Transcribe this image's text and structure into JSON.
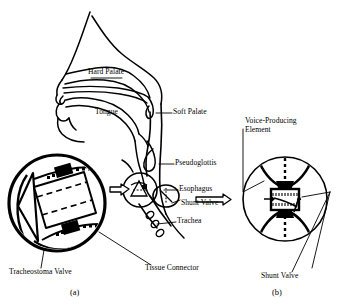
{
  "figure": {
    "background_color": "#ffffff",
    "ink_color": "#000000"
  },
  "panels": [
    {
      "id": "a",
      "letter": "(a)",
      "caption": "(a)"
    },
    {
      "id": "b",
      "letter": "(b)",
      "caption": "(b)"
    }
  ],
  "labels": {
    "hard_palate": "Hard Palate",
    "tongue": "Tongue",
    "soft_palate": "Soft Palate",
    "pseudoglottis": "Pseudoglottis",
    "esophagus": "Esophagus",
    "shunt_valve": "Shunt Valve",
    "trachea": "Trachea",
    "tracheostoma_valve": "Tracheostoma Valve",
    "tissue_connector": "Tissue Connector",
    "voice_producing_element_line1": "Voice-Producing",
    "voice_producing_element_line2": "Element",
    "shunt_valve_b": "Shunt Valve"
  },
  "icons": {
    "callout_arrow_left": "block-arrow-left-icon",
    "callout_arrow_right": "block-arrow-right-icon",
    "pointer_arrow": "arrow-icon"
  }
}
